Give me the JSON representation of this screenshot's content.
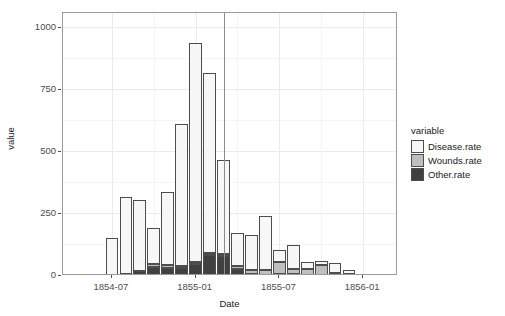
{
  "chart_data": {
    "type": "bar",
    "subtype": "stacked",
    "title": "",
    "xlabel": "Date",
    "ylabel": "value",
    "ylim": [
      0,
      1060
    ],
    "yticks": [
      0,
      250,
      500,
      750,
      1000
    ],
    "ytick_labels": [
      "0",
      "250",
      "500",
      "750",
      "1000"
    ],
    "xtick_labels": [
      "1854-07",
      "1855-01",
      "1855-07",
      "1856-01"
    ],
    "xtick_dates": [
      "1854-07",
      "1855-01",
      "1855-07",
      "1856-01"
    ],
    "grid": true,
    "legend_position": "right",
    "legend_title": "variable",
    "annotation_vline": "1855-03",
    "categories": [
      "1854-04",
      "1854-05",
      "1854-06",
      "1854-07",
      "1854-08",
      "1854-09",
      "1854-10",
      "1854-11",
      "1854-12",
      "1855-01",
      "1855-02",
      "1855-03",
      "1855-04",
      "1855-05",
      "1855-06",
      "1855-07",
      "1855-08",
      "1855-09",
      "1855-10",
      "1855-11",
      "1855-12",
      "1856-01",
      "1856-02",
      "1856-03"
    ],
    "series": [
      {
        "name": "Other.rate",
        "color": "#404040",
        "values": [
          1.4,
          6.2,
          3.4,
          5.0,
          7.2,
          20.6,
          37.5,
          32.1,
          32.1,
          48.3,
          86.6,
          81.0,
          29.4,
          7.2,
          5.2,
          8.9,
          6.6,
          0.9,
          1.4,
          1.6,
          2.3,
          1.3,
          0.5,
          0.0
        ],
        "label": "Other.rate"
      },
      {
        "name": "Wounds.rate",
        "color": "#bfbfbf",
        "values": [
          0.0,
          0.0,
          0.0,
          0.0,
          0.0,
          0.0,
          10.7,
          11.0,
          6.8,
          6.8,
          4.6,
          8.2,
          9.9,
          18.8,
          17.1,
          45.5,
          22.3,
          26.5,
          44.1,
          10.7,
          5.1,
          1.7,
          0.9,
          0.0
        ],
        "label": "Wounds.rate"
      },
      {
        "name": "Disease.rate",
        "color": "#f7f7f7",
        "values": [
          0.0,
          0.0,
          0.0,
          150.0,
          313.0,
          287.0,
          145.0,
          295.0,
          575.0,
          886.0,
          725.0,
          380.0,
          135.0,
          141.0,
          220.0,
          50.0,
          98.0,
          31.0,
          15.0,
          40.0,
          15.0,
          6.0,
          3.0,
          2.0
        ],
        "label": "Disease.rate"
      }
    ],
    "totals": [
      1.4,
      6.2,
      3.4,
      155.0,
      320.2,
      307.6,
      193.2,
      338.1,
      613.9,
      941.1,
      816.2,
      469.2,
      174.3,
      167.0,
      242.3,
      104.4,
      126.9,
      58.4,
      60.5,
      52.3,
      22.4,
      9.0,
      4.4,
      2.0
    ]
  },
  "legend": {
    "title": "variable",
    "items": [
      {
        "label": "Disease.rate",
        "key": "disease"
      },
      {
        "label": "Wounds.rate",
        "key": "wounds"
      },
      {
        "label": "Other.rate",
        "key": "other"
      }
    ]
  },
  "axes": {
    "y_title": "value",
    "x_title": "Date",
    "y_ticks": [
      "1000",
      "750",
      "500",
      "250",
      "0"
    ],
    "x_ticks": [
      "1854-07",
      "1855-01",
      "1855-07",
      "1856-01"
    ]
  },
  "colors": {
    "disease": "#f7f7f7",
    "wounds": "#bfbfbf",
    "other": "#404040",
    "outline": "#4d4d4d",
    "grid": "#ebebeb",
    "panel_border": "#9a9a9a",
    "background": "#ffffff",
    "vline": "#8c8c8c"
  }
}
